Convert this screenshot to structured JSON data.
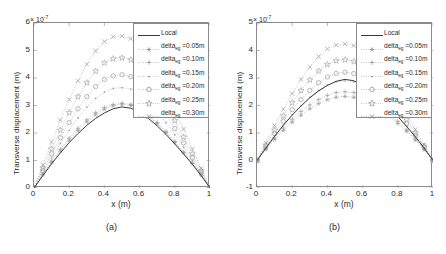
{
  "figure": {
    "panels": [
      {
        "caption": "(a)",
        "axis_exponent": "× 10",
        "axis_exponent_power": "-7",
        "xlabel": "x (m)",
        "ylabel": "Transverse displacement (m)",
        "xticks": [
          "0",
          "0.2",
          "0.4",
          "0.6",
          "0.8",
          "1"
        ],
        "yticks": [
          "0",
          "1",
          "2",
          "3",
          "4",
          "5",
          "6"
        ]
      },
      {
        "caption": "(b)",
        "axis_exponent": "× 10",
        "axis_exponent_power": "-7",
        "xlabel": "x (m)",
        "ylabel": "Transverse displacement (m)",
        "xticks": [
          "0",
          "0.2",
          "0.4",
          "0.6",
          "0.8",
          "1"
        ],
        "yticks": [
          "-1",
          "0",
          "1",
          "2",
          "3",
          "4",
          "5"
        ]
      }
    ],
    "legend": {
      "entries": [
        {
          "label": "Local",
          "marker": "none",
          "style": "solid"
        },
        {
          "label_base": "delta",
          "label_sub": "eg",
          "label_tail": " =0.05m",
          "marker": "asterisk",
          "style": "dotted"
        },
        {
          "label_base": "delta",
          "label_sub": "eg",
          "label_tail": " =0.10m",
          "marker": "plus",
          "style": "dotted"
        },
        {
          "label_base": "delta",
          "label_sub": "eg",
          "label_tail": " =0.15m",
          "marker": "point",
          "style": "dotted"
        },
        {
          "label_base": "delta",
          "label_sub": "eg",
          "label_tail": " =0.20m",
          "marker": "circle",
          "style": "dotted"
        },
        {
          "label_base": "delta",
          "label_sub": "eg",
          "label_tail": " =0.25m",
          "marker": "pentagram",
          "style": "dotted"
        },
        {
          "label_base": "delta",
          "label_sub": "eg",
          "label_tail": " =0.30m",
          "marker": "cross",
          "style": "dotted"
        }
      ]
    }
  },
  "chart_data": [
    {
      "type": "line",
      "panel": "a",
      "title": "",
      "xlabel": "x (m)",
      "ylabel": "Transverse displacement (m)",
      "y_scale": 1e-07,
      "y_exponent_label": "× 10^-7",
      "xlim": [
        0,
        1
      ],
      "ylim": [
        0,
        6
      ],
      "xticks": [
        0,
        0.2,
        0.4,
        0.6,
        0.8,
        1
      ],
      "yticks": [
        0,
        1,
        2,
        3,
        4,
        5,
        6
      ],
      "grid": false,
      "legend_position": "upper right",
      "x": [
        0,
        0.05,
        0.1,
        0.15,
        0.2,
        0.25,
        0.3,
        0.35,
        0.4,
        0.45,
        0.5,
        0.55,
        0.6,
        0.65,
        0.7,
        0.75,
        0.8,
        0.85,
        0.9,
        0.95,
        1
      ],
      "series": [
        {
          "name": "Local",
          "marker": "none",
          "values": [
            0,
            0.45,
            0.88,
            1.28,
            1.65,
            1.98,
            2.28,
            2.53,
            2.73,
            2.88,
            2.95,
            2.9,
            2.75,
            2.53,
            2.26,
            1.95,
            1.6,
            1.24,
            0.86,
            0.45,
            0
          ]
        },
        {
          "name": "delta_eg=0.05m",
          "marker": "asterisk",
          "values": [
            0,
            0.48,
            0.93,
            1.35,
            1.74,
            2.09,
            2.4,
            2.66,
            2.86,
            2.99,
            3.05,
            3.0,
            2.85,
            2.62,
            2.34,
            2.02,
            1.66,
            1.28,
            0.89,
            0.47,
            0
          ]
        },
        {
          "name": "delta_eg=0.10m",
          "marker": "plus",
          "values": [
            0,
            0.5,
            0.97,
            1.41,
            1.81,
            2.17,
            2.48,
            2.74,
            2.93,
            3.04,
            3.08,
            3.04,
            2.9,
            2.67,
            2.38,
            2.05,
            1.69,
            1.3,
            0.9,
            0.48,
            0
          ]
        },
        {
          "name": "delta_eg=0.15m",
          "marker": "point",
          "values": [
            0,
            0.56,
            1.1,
            1.62,
            2.1,
            2.55,
            2.94,
            3.26,
            3.49,
            3.62,
            3.65,
            3.6,
            3.43,
            3.14,
            2.78,
            2.38,
            1.94,
            1.48,
            1.0,
            0.52,
            0
          ]
        },
        {
          "name": "delta_eg=0.20m",
          "marker": "circle",
          "values": [
            0,
            0.63,
            1.24,
            1.83,
            2.38,
            2.88,
            3.32,
            3.69,
            3.95,
            4.08,
            4.12,
            4.05,
            3.86,
            3.53,
            3.12,
            2.66,
            2.16,
            1.64,
            1.1,
            0.57,
            0
          ]
        },
        {
          "name": "delta_eg=0.25m",
          "marker": "pentagram",
          "values": [
            0,
            0.72,
            1.42,
            2.1,
            2.74,
            3.32,
            3.83,
            4.25,
            4.55,
            4.7,
            4.73,
            4.66,
            4.43,
            4.04,
            3.56,
            3.03,
            2.45,
            1.85,
            1.24,
            0.63,
            0
          ]
        },
        {
          "name": "delta_eg=0.30m",
          "marker": "cross",
          "values": [
            0,
            0.84,
            1.67,
            2.47,
            3.22,
            3.9,
            4.5,
            4.99,
            5.33,
            5.5,
            5.52,
            5.43,
            5.16,
            4.7,
            4.14,
            3.52,
            2.84,
            2.14,
            1.42,
            0.72,
            0
          ]
        }
      ]
    },
    {
      "type": "line",
      "panel": "b",
      "title": "",
      "xlabel": "x (m)",
      "ylabel": "Transverse displacement (m)",
      "y_scale": 1e-07,
      "y_exponent_label": "× 10^-7",
      "xlim": [
        0,
        1
      ],
      "ylim": [
        -1,
        5
      ],
      "xticks": [
        0,
        0.2,
        0.4,
        0.6,
        0.8,
        1
      ],
      "yticks": [
        -1,
        0,
        1,
        2,
        3,
        4,
        5
      ],
      "grid": false,
      "legend_position": "upper right",
      "x": [
        0,
        0.05,
        0.1,
        0.15,
        0.2,
        0.25,
        0.3,
        0.35,
        0.4,
        0.45,
        0.5,
        0.55,
        0.6,
        0.65,
        0.7,
        0.75,
        0.8,
        0.85,
        0.9,
        0.95,
        1
      ],
      "series": [
        {
          "name": "Local",
          "marker": "none",
          "values": [
            0,
            0.45,
            0.88,
            1.28,
            1.65,
            1.98,
            2.28,
            2.53,
            2.73,
            2.88,
            2.95,
            2.9,
            2.75,
            2.53,
            2.26,
            1.95,
            1.6,
            1.24,
            0.86,
            0.45,
            0
          ]
        },
        {
          "name": "delta_eg=0.05m",
          "marker": "asterisk",
          "values": [
            0,
            0.4,
            0.76,
            1.09,
            1.39,
            1.65,
            1.88,
            2.07,
            2.21,
            2.3,
            2.33,
            2.3,
            2.2,
            2.05,
            1.85,
            1.62,
            1.35,
            1.06,
            0.74,
            0.39,
            0
          ]
        },
        {
          "name": "delta_eg=0.10m",
          "marker": "plus",
          "values": [
            0,
            0.43,
            0.82,
            1.18,
            1.5,
            1.78,
            2.02,
            2.22,
            2.37,
            2.47,
            2.5,
            2.47,
            2.36,
            2.19,
            1.97,
            1.72,
            1.43,
            1.11,
            0.78,
            0.41,
            0
          ]
        },
        {
          "name": "delta_eg=0.15m",
          "marker": "point",
          "values": [
            0,
            0.46,
            0.9,
            1.3,
            1.67,
            2.0,
            2.3,
            2.55,
            2.74,
            2.86,
            2.9,
            2.86,
            2.73,
            2.52,
            2.25,
            1.94,
            1.6,
            1.24,
            0.86,
            0.45,
            0
          ]
        },
        {
          "name": "delta_eg=0.20m",
          "marker": "circle",
          "values": [
            0,
            0.5,
            0.98,
            1.43,
            1.85,
            2.22,
            2.55,
            2.83,
            3.04,
            3.17,
            3.21,
            3.16,
            3.02,
            2.78,
            2.47,
            2.12,
            1.74,
            1.34,
            0.92,
            0.48,
            0
          ]
        },
        {
          "name": "delta_eg=0.25m",
          "marker": "pentagram",
          "values": [
            0,
            0.56,
            1.1,
            1.62,
            2.1,
            2.54,
            2.93,
            3.25,
            3.49,
            3.63,
            3.66,
            3.6,
            3.43,
            3.15,
            2.79,
            2.38,
            1.94,
            1.48,
            1.0,
            0.52,
            0
          ]
        },
        {
          "name": "delta_eg=0.30m",
          "marker": "cross",
          "values": [
            0,
            0.64,
            1.27,
            1.87,
            2.43,
            2.95,
            3.4,
            3.78,
            4.06,
            4.2,
            4.24,
            4.18,
            3.97,
            3.63,
            3.21,
            2.73,
            2.22,
            1.68,
            1.13,
            0.58,
            0
          ]
        }
      ]
    }
  ]
}
